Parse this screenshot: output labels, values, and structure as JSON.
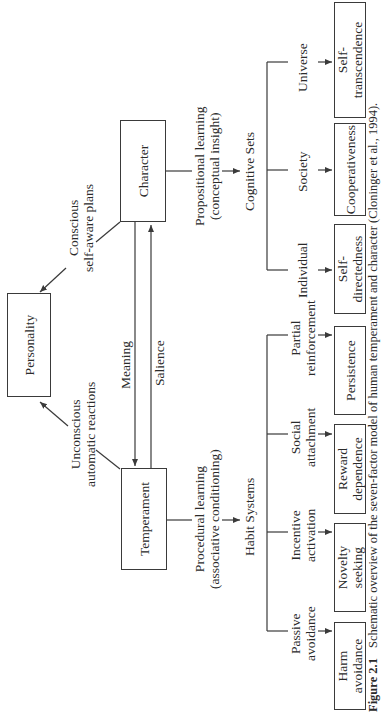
{
  "diagram": {
    "title_nodes": {
      "personality": "Personality",
      "character": "Character",
      "temperament": "Temperament"
    },
    "edge_labels": {
      "conscious": [
        "Conscious",
        "self-aware plans"
      ],
      "unconscious": [
        "Unconscious",
        "automatic reactions"
      ],
      "meaning": "Meaning",
      "salience": "Salience",
      "propositional": [
        "Propositional learning",
        "(conceptual insight)"
      ],
      "procedural": [
        "Procedural learning",
        "(associative conditioning)"
      ]
    },
    "groups": {
      "habit_systems": "Habit Systems",
      "cognitive_sets": "Cognitive Sets"
    },
    "temperament_branches": [
      {
        "label": [
          "Passive",
          "avoidance"
        ],
        "trait": [
          "Harm",
          "avoidance"
        ]
      },
      {
        "label": [
          "Incentive",
          "activation"
        ],
        "trait": [
          "Novelty",
          "seeking"
        ]
      },
      {
        "label": [
          "Social",
          "attachment"
        ],
        "trait": [
          "Reward",
          "dependence"
        ]
      },
      {
        "label": [
          "Partial",
          "reinforcement"
        ],
        "trait": [
          "Persistence"
        ]
      }
    ],
    "character_branches": [
      {
        "label": [
          "Individual"
        ],
        "trait": [
          "Self-",
          "directedness"
        ]
      },
      {
        "label": [
          "Society"
        ],
        "trait": [
          "Cooperativeness"
        ]
      },
      {
        "label": [
          "Universe"
        ],
        "trait": [
          "Self-",
          "transcendence"
        ]
      }
    ],
    "caption": {
      "figure_number": "Figure 2.1",
      "text": "Schematic overview of the seven-factor model of human temperament and character (Cloninger et al., 1994)."
    }
  },
  "colors": {
    "line": "#3a3a3a",
    "text": "#2a2a2a",
    "background": "#ffffff"
  }
}
